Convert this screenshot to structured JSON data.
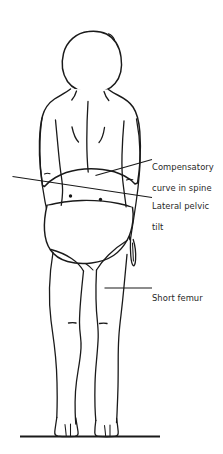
{
  "illustration": {
    "title": "Posterior view of standing figure showing leg length discrepancy",
    "view": "posterior",
    "background_color": "#ffffff",
    "line_color": "#1a1a1a",
    "text_color": "#272727"
  },
  "labels": [
    {
      "id": "compensatory-curve",
      "text": "Compensatory\ncurve in spine",
      "line1": "Compensatory",
      "line2": "curve in spine",
      "points_to": "thoracolumbar spine"
    },
    {
      "id": "lateral-pelvic-tilt",
      "text": "Lateral pelvic\ntilt",
      "line1": "Lateral pelvic",
      "line2": "tilt",
      "points_to": "pelvic brim"
    },
    {
      "id": "short-femur",
      "text": "Short femur",
      "line1": "Short femur",
      "line2": "",
      "points_to": "right thigh"
    }
  ],
  "markers": {
    "psis_left_label": "posterior-superior-iliac-spine-left",
    "psis_right_label": "posterior-superior-iliac-spine-right",
    "ground_label": "ground-line",
    "pelvic_tilt_line_label": "pelvic-tilt-reference-line"
  }
}
